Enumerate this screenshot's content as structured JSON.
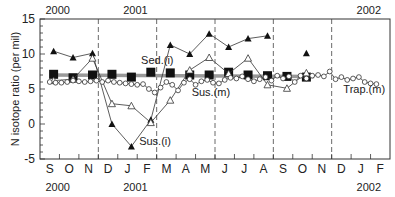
{
  "chart_data": {
    "type": "line",
    "title": "",
    "ylabel": "N isotope ratio (per mil)",
    "xlabel": "",
    "ylim": [
      -5,
      15
    ],
    "yticks": [
      -5,
      0,
      5,
      10,
      15
    ],
    "grid": false,
    "x_months": [
      "S",
      "O",
      "N",
      "D",
      "J",
      "F",
      "M",
      "A",
      "M",
      "J",
      "J",
      "A",
      "S",
      "O",
      "N",
      "D",
      "J",
      "F"
    ],
    "x_year_labels_bottom": [
      {
        "label": "2000",
        "month_index": 0
      },
      {
        "label": "2001",
        "month_index": 4
      },
      {
        "label": "2002",
        "month_index": 16
      }
    ],
    "x_year_labels_top": [
      {
        "label": "2000",
        "month_index": 0
      },
      {
        "label": "2001",
        "month_index": 4
      },
      {
        "label": "2002",
        "month_index": 16
      }
    ],
    "season_dividers_month_pos": [
      3,
      6,
      9,
      12,
      15
    ],
    "series": [
      {
        "name": "Sed.(i)",
        "marker": "filled-square",
        "trend_line": "thick gray horizontal band ~7",
        "x": [
          0.2,
          1.2,
          2.2,
          3.2,
          4.2,
          5.2,
          6.2,
          7.2,
          8.2,
          9.2,
          10.2,
          11.2,
          12.2,
          13.2
        ],
        "values": [
          7.1,
          6.6,
          7.0,
          7.1,
          6.7,
          7.4,
          7.3,
          7.0,
          7.0,
          7.4,
          7.0,
          6.9,
          6.8,
          6.7
        ]
      },
      {
        "name": "Sus.(i)",
        "marker": "filled-triangle",
        "x": [
          0.2,
          1.2,
          2.2,
          3.2,
          4.2,
          5.2,
          6.2,
          7.2,
          8.2,
          9.2,
          10.2,
          11.2,
          13.2
        ],
        "values": [
          10.4,
          9.5,
          10.1,
          0.0,
          -3.2,
          0.6,
          11.3,
          10.0,
          12.9,
          11.0,
          12.2,
          12.6,
          10.1
        ]
      },
      {
        "name": "Sus.(m)",
        "marker": "open-triangle",
        "x": [
          0.2,
          1.2,
          2.2,
          3.2,
          4.2,
          5.2,
          6.2,
          7.2,
          8.2,
          9.2,
          10.2,
          11.2,
          12.2,
          13.2
        ],
        "values": [
          6.2,
          6.4,
          9.4,
          2.9,
          2.6,
          0.2,
          3.4,
          7.7,
          9.5,
          7.2,
          9.4,
          5.6,
          5.1,
          7.3
        ]
      },
      {
        "name": "Trap.(m)",
        "marker": "open-circle",
        "x": [
          0.0,
          0.3,
          0.6,
          0.9,
          1.2,
          1.5,
          1.8,
          2.1,
          2.4,
          2.7,
          3.0,
          3.3,
          3.6,
          3.9,
          4.2,
          4.5,
          4.8,
          5.1,
          5.4,
          5.7,
          6.0,
          6.3,
          6.6,
          6.9,
          7.2,
          7.5,
          7.8,
          8.1,
          8.4,
          8.7,
          9.0,
          9.3,
          9.6,
          9.9,
          10.2,
          10.5,
          10.8,
          11.1,
          11.4,
          11.7,
          12.0,
          12.3,
          12.6,
          12.9,
          13.2,
          13.5,
          13.8,
          14.1,
          14.4,
          14.7,
          15.0,
          15.3,
          15.6,
          15.9,
          16.2,
          16.5,
          16.8
        ],
        "values": [
          6.0,
          5.9,
          5.9,
          6.0,
          6.2,
          6.1,
          6.0,
          6.1,
          6.2,
          6.0,
          6.2,
          6.0,
          5.9,
          5.8,
          5.7,
          5.6,
          5.7,
          5.0,
          4.5,
          5.2,
          6.0,
          5.6,
          4.8,
          5.9,
          6.4,
          5.6,
          6.1,
          6.3,
          5.9,
          5.8,
          6.3,
          6.6,
          6.5,
          6.8,
          6.4,
          6.1,
          6.4,
          6.7,
          6.2,
          6.9,
          6.5,
          6.8,
          6.0,
          6.9,
          6.5,
          6.9,
          7.0,
          6.8,
          7.5,
          6.4,
          6.7,
          6.3,
          6.5,
          6.7,
          6.0,
          5.8,
          5.7
        ]
      }
    ],
    "annotations": [
      {
        "text": "Sed.(i)",
        "x": 4.7,
        "y": 8.6
      },
      {
        "text": "Sus.(m)",
        "x": 7.3,
        "y": 4.0
      },
      {
        "text": "Sus.(i)",
        "x": 4.6,
        "y": -3.0
      },
      {
        "text": "Trap.(m)",
        "x": 15.1,
        "y": 4.5
      }
    ]
  }
}
